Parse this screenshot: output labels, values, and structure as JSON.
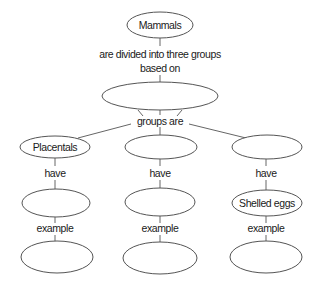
{
  "diagram": {
    "type": "concept-map",
    "nodes": {
      "mammals": {
        "label": "Mammals"
      },
      "criteria": {
        "label": ""
      },
      "group_1": {
        "label": "Placentals"
      },
      "group_2": {
        "label": ""
      },
      "group_3": {
        "label": ""
      },
      "trait_1": {
        "label": ""
      },
      "trait_2": {
        "label": ""
      },
      "trait_3": {
        "label": "Shelled eggs"
      },
      "example_1": {
        "label": ""
      },
      "example_2": {
        "label": ""
      },
      "example_3": {
        "label": ""
      }
    },
    "links": {
      "divided_line1": "are divided into three groups",
      "divided_line2": "based on",
      "groups_are": "groups are",
      "have_1": "have",
      "have_2": "have",
      "have_3": "have",
      "example_1": "example",
      "example_2": "example",
      "example_3": "example"
    },
    "colors": {
      "stroke": "#555555",
      "text": "#1a1a1a",
      "background": "#ffffff"
    }
  }
}
